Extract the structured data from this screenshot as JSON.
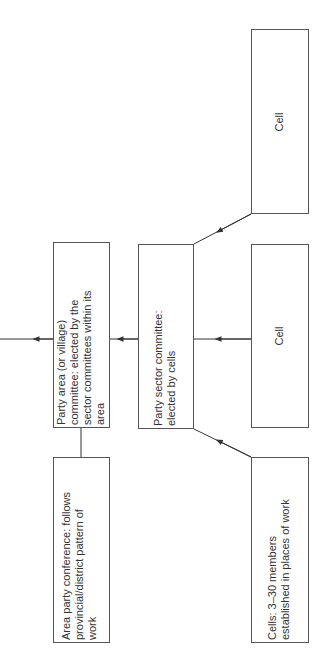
{
  "diagram": {
    "orientation": "rotated-90-ccw",
    "colors": {
      "line": "#333333",
      "box_border": "#555555",
      "text": "#333333",
      "background": "#ffffff"
    },
    "nodes": [
      {
        "id": "area-committee",
        "label": "Party area (or village)\ncommittee: elected by the\nsector committees within its\narea"
      },
      {
        "id": "area-conference",
        "label": "Area party conference: follows\nprovincial/district pattern of\nwork"
      },
      {
        "id": "sector-committee",
        "label": "Party sector committee:\nelected by cells"
      },
      {
        "id": "cell-top",
        "label": "Cell"
      },
      {
        "id": "cell-middle",
        "label": "Cell"
      },
      {
        "id": "cells-bottom",
        "label": "Cells: 3–30 members\nestablished in places of work"
      }
    ],
    "edges": [
      {
        "from": "cell-top",
        "to": "sector-committee",
        "arrow": true
      },
      {
        "from": "cell-middle",
        "to": "sector-committee",
        "arrow": true
      },
      {
        "from": "cells-bottom",
        "to": "sector-committee",
        "arrow": true
      },
      {
        "from": "sector-committee",
        "to": "area-committee",
        "arrow": true
      },
      {
        "from": "area-committee",
        "to": "off-page-left",
        "arrow": true
      },
      {
        "from": "area-committee",
        "to": "area-conference",
        "arrow": false
      }
    ]
  }
}
